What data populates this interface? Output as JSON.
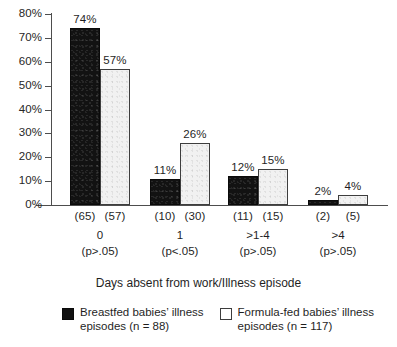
{
  "chart_data": {
    "type": "bar",
    "title": "",
    "xlabel": "Days absent from work/Illness episode",
    "ylabel": "",
    "ylim": [
      0,
      80
    ],
    "ytick_values": [
      0,
      10,
      20,
      30,
      40,
      50,
      60,
      70,
      80
    ],
    "ytick_labels": [
      "0%",
      "10%",
      "20%",
      "30%",
      "40%",
      "50%",
      "60%",
      "70%",
      "80%"
    ],
    "grid": false,
    "legend_position": "bottom",
    "categories": [
      "0",
      "1",
      ">1-4",
      ">4"
    ],
    "category_significance": [
      "(p>.05)",
      "(p<.05)",
      "(p>.05)",
      "(p>.05)"
    ],
    "series": [
      {
        "name": "Breastfed babies' illness episodes (n = 88)",
        "color": "#111111",
        "values": [
          74,
          11,
          12,
          2
        ],
        "value_labels": [
          "74%",
          "11%",
          "12%",
          "2%"
        ],
        "counts": [
          "(65)",
          "(10)",
          "(11)",
          "(2)"
        ]
      },
      {
        "name": "Formula-fed babies' illness episodes (n = 117)",
        "color": "#f1f1f1",
        "values": [
          57,
          26,
          15,
          4
        ],
        "value_labels": [
          "57%",
          "26%",
          "15%",
          "4%"
        ],
        "counts": [
          "(57)",
          "(30)",
          "(15)",
          "(5)"
        ]
      }
    ]
  },
  "legend": {
    "items": [
      {
        "swatch": "dark",
        "label": "Breastfed babies’ illness\nepisodes (n = 88)"
      },
      {
        "swatch": "light",
        "label": "Formula-fed babies’ illness\nepisodes (n = 117)"
      }
    ]
  },
  "axis_title": "Days absent from work/Illness episode",
  "colors": {
    "breastfed": "#111111",
    "formula_fed": "#f1f1f1",
    "axis": "#4d4d4d",
    "text": "#1f1f1f",
    "background": "#ffffff"
  }
}
